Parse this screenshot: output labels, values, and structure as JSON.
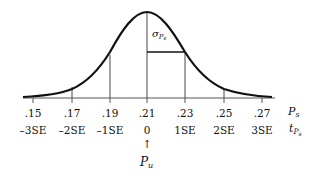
{
  "diagram": {
    "sigma_label": {
      "symbol": "σ",
      "sub": "P",
      "subsub": "s"
    },
    "axis_ps": {
      "name": "P",
      "sub": "s"
    },
    "axis_tps": {
      "name": "t",
      "sub": "P",
      "subsub": "s"
    },
    "pu": {
      "arrow": "↑",
      "name": "P",
      "sub": "u"
    },
    "ticks": [
      {
        "p": ".15",
        "t": "–3SE",
        "x": 33
      },
      {
        "p": ".17",
        "t": "–2SE",
        "x": 72
      },
      {
        "p": ".19",
        "t": "–1SE",
        "x": 110
      },
      {
        "p": ".21",
        "t": "0",
        "x": 147
      },
      {
        "p": ".23",
        "t": "1SE",
        "x": 185
      },
      {
        "p": ".25",
        "t": "2SE",
        "x": 224
      },
      {
        "p": ".27",
        "t": "3SE",
        "x": 262
      }
    ],
    "colors": {
      "line": "#111111",
      "axis": "#555555"
    }
  }
}
